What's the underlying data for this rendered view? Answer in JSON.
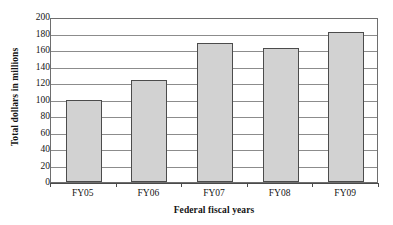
{
  "chart_data": {
    "type": "bar",
    "title": "",
    "subtitle": "",
    "categories": [
      "FY05",
      "FY06",
      "FY07",
      "FY08",
      "FY09"
    ],
    "values": [
      100,
      124,
      169,
      163,
      182
    ],
    "xlabel": "Federal fiscal years",
    "ylabel": "Total dollars in millions",
    "ylim": [
      0,
      200
    ],
    "ytick_step": 20,
    "yticks": [
      0,
      20,
      40,
      60,
      80,
      100,
      120,
      140,
      160,
      180,
      200
    ],
    "ytick_labels": [
      "0",
      "20",
      "40",
      "60",
      "80",
      "100",
      "120",
      "140",
      "160",
      "180",
      "200"
    ],
    "grid": "horizontal",
    "legend": "none",
    "legend_position": "none",
    "bar_fill_color": "#d2d2d2",
    "bar_border_color": "#4c4c4c",
    "plot_border_color": "#6e6e6e",
    "gridline_color": "#8c8c8c",
    "background_color": "#ffffff",
    "annotations": []
  }
}
